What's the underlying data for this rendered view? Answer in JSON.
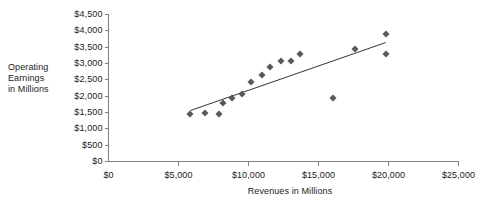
{
  "chart_data": {
    "type": "scatter",
    "title": "",
    "xlabel": "Revenues in Millions",
    "ylabel": "Operating Earnings in Millions",
    "ylabel_lines": [
      "Operating",
      "Earnings",
      "in Millions"
    ],
    "xlim": [
      0,
      25000
    ],
    "ylim": [
      0,
      4500
    ],
    "grid": false,
    "legend": false,
    "xticks": [
      0,
      5000,
      10000,
      15000,
      20000,
      25000
    ],
    "xtick_labels": [
      "$0",
      "$5,000",
      "$10,000",
      "$15,000",
      "$20,000",
      "$25,000"
    ],
    "yticks": [
      0,
      500,
      1000,
      1500,
      2000,
      2500,
      3000,
      3500,
      4000,
      4500
    ],
    "ytick_labels": [
      "$0",
      "$500",
      "$1,000",
      "$1,500",
      "$2,000",
      "$2,500",
      "$3,000",
      "$3,500",
      "$4,000",
      "$4,500"
    ],
    "marker_shape": "diamond",
    "marker_color": "#585858",
    "axis_color": "#808080",
    "trendline": {
      "color": "#333333",
      "x_start": 5850,
      "y_start": 1560,
      "x_end": 19800,
      "y_end": 3640
    },
    "points": [
      {
        "x": 5850,
        "y": 1440
      },
      {
        "x": 6900,
        "y": 1470
      },
      {
        "x": 7900,
        "y": 1440
      },
      {
        "x": 8150,
        "y": 1800
      },
      {
        "x": 8800,
        "y": 1930
      },
      {
        "x": 9550,
        "y": 2080
      },
      {
        "x": 10200,
        "y": 2440
      },
      {
        "x": 10950,
        "y": 2650
      },
      {
        "x": 11500,
        "y": 2900
      },
      {
        "x": 12300,
        "y": 3080
      },
      {
        "x": 13000,
        "y": 3080
      },
      {
        "x": 13700,
        "y": 3290
      },
      {
        "x": 16000,
        "y": 1950
      },
      {
        "x": 17600,
        "y": 3440
      },
      {
        "x": 19800,
        "y": 3900
      },
      {
        "x": 19800,
        "y": 3290
      }
    ]
  }
}
